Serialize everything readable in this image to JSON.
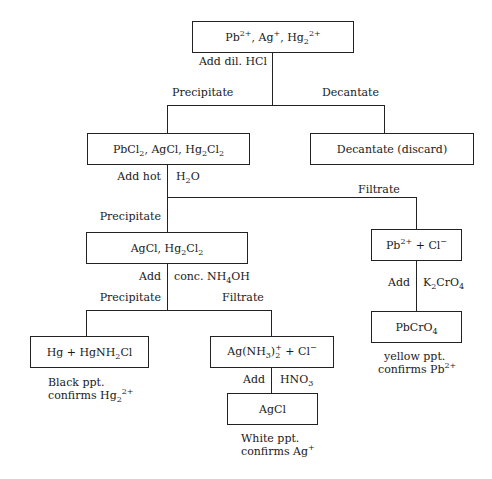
{
  "diagram": {
    "type": "flowchart",
    "nodes": {
      "start": {
        "parts": [
          "Pb",
          "2+",
          ", Ag",
          "+",
          ", Hg",
          "2",
          "2+"
        ]
      },
      "chlorides": {
        "parts": [
          "PbCl",
          "2",
          ", AgCl, Hg",
          "2",
          "Cl",
          "2"
        ]
      },
      "decant_discard": {
        "label": "Decantate (discard)"
      },
      "agcl_hg2cl2": {
        "parts": [
          "AgCl, Hg",
          "2",
          "Cl",
          "2"
        ]
      },
      "pb_cl": {
        "parts": [
          "Pb",
          "2+",
          " + Cl",
          "−"
        ]
      },
      "pbcro4": {
        "parts": [
          "PbCrO",
          "4"
        ]
      },
      "hg_hgnh2cl": {
        "parts": [
          "Hg + HgNH",
          "2",
          "Cl"
        ]
      },
      "ag_nh3": {
        "parts": [
          "Ag(NH",
          "3",
          ")",
          "+",
          "2",
          " + Cl",
          "−"
        ]
      },
      "agcl_final": {
        "label": "AgCl"
      }
    },
    "edge_labels": {
      "add_dil_hcl": "Add dil. HCl",
      "precipitate_1": "Precipitate",
      "decantate": "Decantate",
      "add_hot": "Add hot",
      "h2o": [
        "H",
        "2",
        "O"
      ],
      "filtrate_1": "Filtrate",
      "precipitate_2": "Precipitate",
      "add_1": "Add",
      "conc_nh4oh": [
        "conc. NH",
        "4",
        "OH"
      ],
      "precipitate_3": "Precipitate",
      "filtrate_2": "Filtrate",
      "add_2": "Add",
      "k2cro4": [
        "K",
        "2",
        "CrO",
        "4"
      ],
      "add_3": "Add",
      "hno3": [
        "HNO",
        "3"
      ]
    },
    "results": {
      "black": {
        "line1": "Black ppt.",
        "line2": [
          "confirms Hg",
          "2",
          "2+"
        ]
      },
      "yellow": {
        "line1": "yellow ppt.",
        "line2": [
          "confirms Pb",
          "2+"
        ]
      },
      "white": {
        "line1": "White ppt.",
        "line2": [
          "confirms Ag",
          "+"
        ]
      }
    }
  }
}
